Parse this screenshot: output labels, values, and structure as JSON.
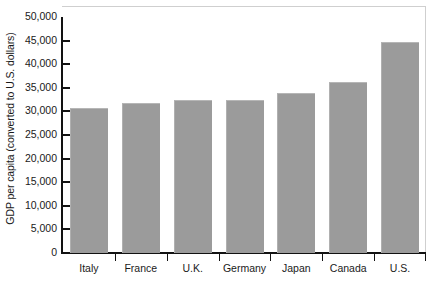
{
  "chart_data": {
    "type": "bar",
    "title": "",
    "xlabel": "",
    "ylabel": "GDP per capita (converted to U.S. dollars)",
    "categories": [
      "Italy",
      "France",
      "U.K.",
      "Germany",
      "Japan",
      "Canada",
      "U.S."
    ],
    "values": [
      30700,
      31700,
      32400,
      32500,
      33900,
      36300,
      44800
    ],
    "ylim": [
      0,
      50000
    ],
    "ytick_values": [
      0,
      5000,
      10000,
      15000,
      20000,
      25000,
      30000,
      35000,
      40000,
      45000,
      50000
    ],
    "ytick_labels": [
      "0",
      "5,000",
      "10,000",
      "15,000",
      "20,000",
      "25,000",
      "30,000",
      "35,000",
      "40,000",
      "45,000",
      "50,000"
    ],
    "grid": false,
    "legend": null,
    "series": [
      {
        "name": "GDP per capita",
        "values": [
          30700,
          31700,
          32400,
          32500,
          33900,
          36300,
          44800
        ]
      }
    ],
    "colors": {
      "bar_fill": "#9b9b9b",
      "bar_edge": "#b6b6b6",
      "axis": "#121212",
      "frame": "#cfcfcf",
      "background": "#ffffff"
    }
  }
}
